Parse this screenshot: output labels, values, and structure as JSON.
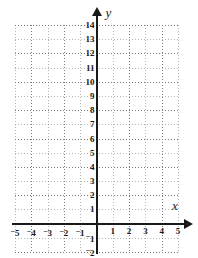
{
  "figure": {
    "kind": "cartesian-coordinate-grid",
    "background_color": "#ffffff",
    "axis_color": "#1a1a1a",
    "grid_color": "#7a7a7a"
  },
  "axes": {
    "x": {
      "label": "x",
      "min": -5,
      "max": 5,
      "step": 1,
      "arrow": "right",
      "tick_labels": [
        "-5",
        "-4",
        "-3",
        "-2",
        "-1",
        "1",
        "2",
        "3",
        "4",
        "5"
      ],
      "tick_values": [
        -5,
        -4,
        -3,
        -2,
        -1,
        1,
        2,
        3,
        4,
        5
      ]
    },
    "y": {
      "label": "y",
      "min": -2,
      "max": 14,
      "step": 1,
      "arrow": "up",
      "tick_labels": [
        "14",
        "13",
        "12",
        "11",
        "10",
        "9",
        "8",
        "7",
        "6",
        "5",
        "4",
        "3",
        "2",
        "1",
        "-1",
        "-2"
      ],
      "tick_values": [
        14,
        13,
        12,
        11,
        10,
        9,
        8,
        7,
        6,
        5,
        4,
        3,
        2,
        1,
        -1,
        -2
      ]
    }
  },
  "chart_data": {
    "type": "scatter",
    "title": "",
    "xlabel": "x",
    "ylabel": "y",
    "xlim": [
      -5,
      5
    ],
    "ylim": [
      -2,
      14
    ],
    "xticks": [
      -5,
      -4,
      -3,
      -2,
      -1,
      0,
      1,
      2,
      3,
      4,
      5
    ],
    "yticks": [
      -2,
      -1,
      0,
      1,
      2,
      3,
      4,
      5,
      6,
      7,
      8,
      9,
      10,
      11,
      12,
      13,
      14
    ],
    "grid": true,
    "grid_style": "dotted",
    "legend": false,
    "series": [],
    "values": [],
    "note": "Empty coordinate plane - no data plotted"
  }
}
